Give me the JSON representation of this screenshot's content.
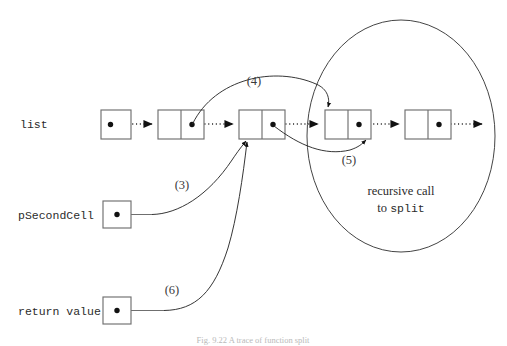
{
  "figure": {
    "title_caption": "Fig. 9.22 A trace of function split",
    "background_color": "#ffffff",
    "ink_color": "#2b2b2b"
  },
  "labels": {
    "list": "list",
    "p_second_cell": "pSecondCell",
    "return_value": "return value",
    "recursive_call_line1": "recursive call",
    "recursive_call_line2_prefix": "to ",
    "recursive_call_line2_code": "split"
  },
  "steps": {
    "step3": "(3)",
    "step4": "(4)",
    "step5": "(5)",
    "step6": "(6)"
  },
  "list_cells": [
    {
      "id": "head-cell",
      "type": "single",
      "has_pointer_dot": true
    },
    {
      "id": "cell-2",
      "type": "double",
      "has_pointer_dot": true
    },
    {
      "id": "cell-3",
      "type": "double",
      "has_pointer_dot": true
    },
    {
      "id": "cell-4",
      "type": "double",
      "has_pointer_dot": true
    },
    {
      "id": "cell-5",
      "type": "double",
      "has_pointer_dot": true
    }
  ],
  "variable_boxes": [
    {
      "id": "p-second-cell-box",
      "label_key": "p_second_cell",
      "has_pointer_dot": true
    },
    {
      "id": "return-value-box",
      "label_key": "return_value",
      "has_pointer_dot": true
    }
  ],
  "region": {
    "name": "recursive-call-region",
    "shape": "ellipse"
  }
}
